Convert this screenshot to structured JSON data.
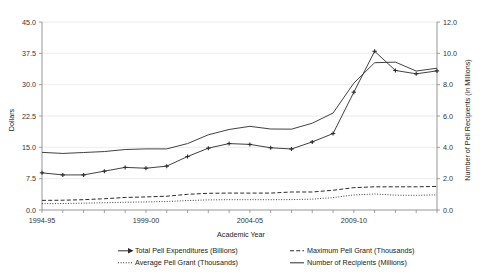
{
  "chart_data": {
    "type": "line",
    "title": "",
    "xlabel": "Academic Year",
    "ylabel": "Dollars",
    "y2label": "Number of Pell Recipients (in Millions)",
    "grid": true,
    "legend_position": "bottom",
    "ylim": [
      0.0,
      45.0
    ],
    "y2lim": [
      0.0,
      12.0
    ],
    "yticks": [
      "0.0",
      "7.5",
      "15.0",
      "22.5",
      "30.0",
      "37.5",
      "45.0"
    ],
    "y2ticks": [
      "0.0",
      "2.0",
      "4.0",
      "6.0",
      "8.0",
      "10.0",
      "12.0"
    ],
    "categories": [
      "1994-95",
      "1995-96",
      "1996-97",
      "1997-98",
      "1998-99",
      "1999-00",
      "2000-01",
      "2001-02",
      "2002-03",
      "2003-04",
      "2004-05",
      "2005-06",
      "2006-07",
      "2007-08",
      "2008-09",
      "2009-10",
      "2010-11",
      "2011-12",
      "2012-13",
      "2013-14"
    ],
    "xtick_labels": [
      "1994-95",
      "1999-00",
      "2004-05",
      "2009-10"
    ],
    "xtick_indices": [
      0,
      5,
      10,
      15
    ],
    "series": [
      {
        "name": "Total Pell Expenditures (Billions)",
        "axis": "left",
        "style": "solid-marker",
        "marker": "arrow",
        "values": [
          8.9,
          8.4,
          8.4,
          9.3,
          10.2,
          10.0,
          10.5,
          12.8,
          14.8,
          15.9,
          15.7,
          14.9,
          14.6,
          16.3,
          18.3,
          28.2,
          38.0,
          33.4,
          32.6,
          33.3
        ]
      },
      {
        "name": "Maximum Pell Grant (Thousands)",
        "axis": "left",
        "style": "dashed",
        "marker": "none",
        "values": [
          2.3,
          2.34,
          2.47,
          2.7,
          3.0,
          3.13,
          3.3,
          3.75,
          4.0,
          4.05,
          4.05,
          4.05,
          4.31,
          4.31,
          4.73,
          5.35,
          5.55,
          5.55,
          5.55,
          5.645
        ]
      },
      {
        "name": "Average Pell Grant (Thousands)",
        "axis": "left",
        "style": "dotted",
        "marker": "none",
        "values": [
          1.52,
          1.55,
          1.63,
          1.73,
          1.85,
          1.93,
          2.04,
          2.25,
          2.42,
          2.47,
          2.47,
          2.46,
          2.49,
          2.6,
          2.97,
          3.6,
          3.83,
          3.55,
          3.51,
          3.63
        ]
      },
      {
        "name": "Number of Recipients (Millions)",
        "axis": "right",
        "style": "solid",
        "marker": "none",
        "values": [
          3.68,
          3.61,
          3.67,
          3.73,
          3.86,
          3.9,
          3.9,
          4.24,
          4.8,
          5.14,
          5.34,
          5.17,
          5.16,
          5.54,
          6.19,
          8.1,
          9.4,
          9.44,
          8.87,
          9.05
        ]
      }
    ]
  }
}
